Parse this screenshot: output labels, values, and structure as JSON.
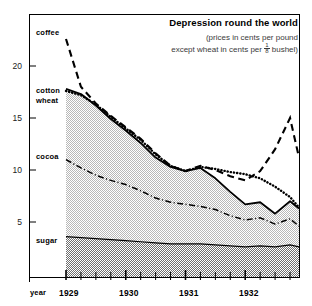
{
  "header": {
    "title": "Depression round the world",
    "subtitle_line1": "(prices in cents per pound",
    "subtitle_line2_pre": "except wheat in cents per",
    "fraction_numerator": "1",
    "fraction_denominator": "8",
    "subtitle_line2_post": "bushel)"
  },
  "axes": {
    "y_ticks": [
      "20",
      "15",
      "10",
      "5"
    ],
    "x_label": "year",
    "x_ticks": [
      "1929",
      "1930",
      "1931",
      "1932"
    ]
  },
  "series_labels": {
    "coffee": "coffee",
    "cotton": "cotton",
    "wheat": "wheat",
    "cocoa": "cocoa",
    "sugar": "sugar"
  },
  "colors": {
    "ink": "#000000",
    "band_light": "#d9d9d9",
    "band_dark": "#8c8c8c",
    "subtitle": "#3a3a3a"
  },
  "chart_data": {
    "type": "line",
    "title": "Depression round the world",
    "subtitle": "(prices in cents per pound except wheat in cents per 1/8 bushel)",
    "xlabel": "year",
    "ylabel": "",
    "xlim": [
      1929.0,
      1932.9
    ],
    "ylim": [
      0,
      23.5
    ],
    "yticks": [
      5,
      10,
      15,
      20
    ],
    "xticks": [
      1929,
      1930,
      1931,
      1932
    ],
    "xtick_minor_step": 0.25,
    "grid": false,
    "legend": "inline-left-labels",
    "x": [
      1929.0,
      1929.25,
      1929.5,
      1929.75,
      1930.0,
      1930.25,
      1930.5,
      1930.75,
      1931.0,
      1931.25,
      1931.5,
      1931.75,
      1932.0,
      1932.25,
      1932.5,
      1932.75,
      1932.9
    ],
    "series": [
      {
        "name": "coffee",
        "style": "dashed",
        "values": [
          22.6,
          18.0,
          16.4,
          15.2,
          14.1,
          13.0,
          11.6,
          10.4,
          9.9,
          10.4,
          10.0,
          9.4,
          9.0,
          9.9,
          12.0,
          15.0,
          11.2
        ]
      },
      {
        "name": "cotton",
        "style": "solid",
        "values": [
          17.8,
          17.3,
          16.2,
          14.9,
          13.8,
          12.6,
          11.2,
          10.3,
          9.9,
          10.2,
          9.2,
          7.9,
          6.7,
          6.9,
          5.8,
          7.0,
          6.3
        ]
      },
      {
        "name": "wheat",
        "style": "dotted",
        "values": [
          17.6,
          17.2,
          16.3,
          15.1,
          14.0,
          12.9,
          11.5,
          10.4,
          9.9,
          10.3,
          10.1,
          9.8,
          9.6,
          9.2,
          8.4,
          7.4,
          6.4
        ]
      },
      {
        "name": "cocoa",
        "style": "dash-dot",
        "values": [
          11.0,
          10.2,
          9.5,
          9.0,
          8.6,
          8.0,
          7.3,
          6.9,
          6.7,
          6.5,
          6.2,
          5.6,
          5.2,
          5.4,
          4.8,
          5.3,
          4.6
        ]
      },
      {
        "name": "sugar",
        "style": "filled-band-top",
        "values": [
          3.6,
          3.5,
          3.4,
          3.3,
          3.2,
          3.1,
          3.0,
          2.9,
          2.9,
          2.9,
          2.8,
          2.7,
          2.6,
          2.7,
          2.6,
          2.8,
          2.6
        ]
      }
    ]
  }
}
